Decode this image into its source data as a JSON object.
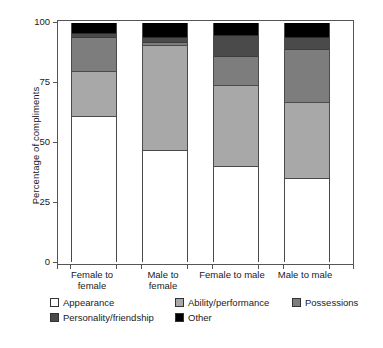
{
  "chart_data": {
    "type": "bar",
    "subtype": "stacked-bar-100",
    "title": "",
    "xlabel": "",
    "ylabel": "Percentage of compliments",
    "ylim": [
      0,
      100
    ],
    "yticks": [
      0,
      25,
      50,
      75,
      100
    ],
    "ytick_labels": [
      "0",
      "25",
      "50",
      "75",
      "100"
    ],
    "grid": false,
    "legend_position": "bottom",
    "categories": [
      "Female to female",
      "Male to female",
      "Female to male",
      "Male to male"
    ],
    "category_lines": [
      [
        "Female to",
        "female"
      ],
      [
        "Male to",
        "female"
      ],
      [
        "Female to male",
        ""
      ],
      [
        "Male to male",
        ""
      ]
    ],
    "series": [
      {
        "name": "Appearance",
        "color": "#ffffff",
        "values": [
          61,
          47,
          40,
          35
        ]
      },
      {
        "name": "Ability/performance",
        "color": "#a8a8a8",
        "values": [
          19,
          44,
          34,
          32
        ]
      },
      {
        "name": "Possessions",
        "color": "#7d7d7d",
        "values": [
          14,
          1,
          12,
          22
        ]
      },
      {
        "name": "Personality/friendship",
        "color": "#4a4a4a",
        "values": [
          2,
          2,
          9,
          5
        ]
      },
      {
        "name": "Other",
        "color": "#000000",
        "values": [
          4,
          6,
          5,
          6
        ]
      }
    ]
  },
  "axis": {
    "y_title": "Percentage of compliments",
    "y_tick_0": "0",
    "y_tick_1": "25",
    "y_tick_2": "50",
    "y_tick_3": "75",
    "y_tick_4": "100"
  },
  "xlabels": {
    "b0_line1": "Female to",
    "b0_line2": "female",
    "b1_line1": "Male to",
    "b1_line2": "female",
    "b2_line1": "Female to male",
    "b2_line2": "",
    "b3_line1": "Male to male",
    "b3_line2": ""
  },
  "legend": {
    "items": [
      {
        "label": "Appearance",
        "color": "#ffffff"
      },
      {
        "label": "Ability/performance",
        "color": "#a8a8a8"
      },
      {
        "label": "Possessions",
        "color": "#7d7d7d"
      },
      {
        "label": "Personality/friendship",
        "color": "#4a4a4a"
      },
      {
        "label": "Other",
        "color": "#000000"
      }
    ]
  }
}
